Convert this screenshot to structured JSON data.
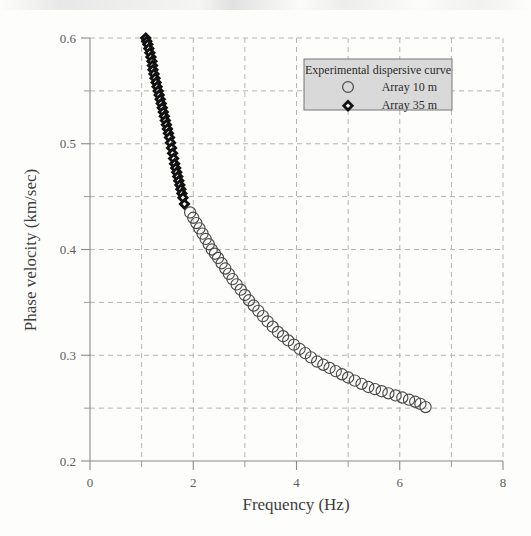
{
  "chart_data": {
    "type": "scatter",
    "title": "",
    "xlabel": "Frequency (Hz)",
    "ylabel": "Phase velocity (km/sec)",
    "xlim": [
      0,
      8
    ],
    "ylim": [
      0.2,
      0.6
    ],
    "xticks": [
      0,
      2,
      4,
      6,
      8
    ],
    "xtick_labels": [
      "0",
      "2",
      "4",
      "6",
      "8"
    ],
    "xminorticks": [
      1,
      3,
      5,
      7
    ],
    "yticks": [
      0.2,
      0.3,
      0.4,
      0.5,
      0.6
    ],
    "ytick_labels": [
      "0.2",
      "0.3",
      "0.4",
      "0.5",
      "0.6"
    ],
    "yminorticks": [
      0.25,
      0.35,
      0.45,
      0.55
    ],
    "grid": true,
    "grid_style": "dashed",
    "grid_color": "#b4b4b4",
    "legend_position": "upper-right",
    "legend_title": "Experimental dispersive curve",
    "series": [
      {
        "name": "Array 10 m",
        "marker": "circle-open",
        "color": "#4a4a4a",
        "x": [
          1.94,
          2.0,
          2.06,
          2.12,
          2.18,
          2.24,
          2.3,
          2.36,
          2.42,
          2.48,
          2.55,
          2.62,
          2.69,
          2.76,
          2.84,
          2.92,
          3.0,
          3.08,
          3.17,
          3.26,
          3.35,
          3.44,
          3.54,
          3.64,
          3.74,
          3.84,
          3.95,
          4.06,
          4.17,
          4.28,
          4.4,
          4.52,
          4.64,
          4.76,
          4.88,
          5.0,
          5.13,
          5.26,
          5.39,
          5.52,
          5.65,
          5.78,
          5.92,
          6.05,
          6.18,
          6.3,
          6.4,
          6.5
        ],
        "y": [
          0.435,
          0.43,
          0.425,
          0.42,
          0.415,
          0.41,
          0.405,
          0.4,
          0.396,
          0.392,
          0.387,
          0.382,
          0.377,
          0.372,
          0.367,
          0.362,
          0.357,
          0.352,
          0.347,
          0.342,
          0.337,
          0.332,
          0.327,
          0.322,
          0.318,
          0.314,
          0.31,
          0.306,
          0.302,
          0.298,
          0.294,
          0.291,
          0.288,
          0.285,
          0.282,
          0.279,
          0.276,
          0.273,
          0.27,
          0.268,
          0.266,
          0.264,
          0.262,
          0.26,
          0.258,
          0.256,
          0.254,
          0.251
        ]
      },
      {
        "name": "Array 35 m",
        "marker": "diamond-filled",
        "color": "#111111",
        "x": [
          1.08,
          1.1,
          1.12,
          1.14,
          1.16,
          1.18,
          1.2,
          1.21,
          1.22,
          1.24,
          1.26,
          1.28,
          1.3,
          1.32,
          1.34,
          1.36,
          1.38,
          1.4,
          1.42,
          1.44,
          1.46,
          1.48,
          1.5,
          1.52,
          1.54,
          1.56,
          1.58,
          1.6,
          1.62,
          1.64,
          1.66,
          1.68,
          1.7,
          1.72,
          1.74,
          1.76,
          1.78,
          1.8,
          1.83
        ],
        "y": [
          0.6,
          0.597,
          0.594,
          0.59,
          0.586,
          0.582,
          0.578,
          0.574,
          0.57,
          0.566,
          0.562,
          0.558,
          0.554,
          0.55,
          0.546,
          0.542,
          0.538,
          0.534,
          0.53,
          0.526,
          0.522,
          0.518,
          0.514,
          0.51,
          0.506,
          0.501,
          0.496,
          0.491,
          0.486,
          0.481,
          0.477,
          0.473,
          0.469,
          0.465,
          0.461,
          0.457,
          0.453,
          0.449,
          0.443
        ]
      }
    ]
  },
  "legend": {
    "title": "Experimental dispersive curve",
    "entries": [
      {
        "label": "Array 10 m",
        "marker": "circle-open"
      },
      {
        "label": "Array 35 m",
        "marker": "diamond-filled"
      }
    ]
  }
}
